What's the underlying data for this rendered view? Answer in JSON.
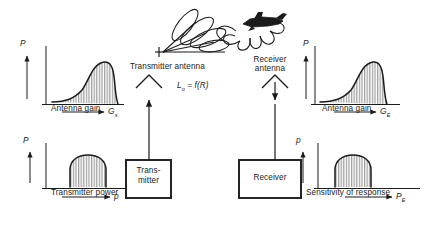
{
  "diagram": {
    "ink_color": "#1b1b1b",
    "hatch_color": "#555555",
    "background": "#ffffff"
  },
  "transmitter_branch": {
    "antenna_label": "Transmitter antenna",
    "box_line1": "Trans-",
    "box_line2": "mitter",
    "gain_plot": {
      "y_axis": "P",
      "caption": "Antenna gain",
      "x_axis_symbol": "G",
      "x_axis_subscript": "s",
      "curve_type": "skewed-peak"
    },
    "power_plot": {
      "y_axis": "P",
      "caption": "Transmitter power",
      "x_axis_symbol": "p",
      "x_axis_subscript": "",
      "curve_type": "dome"
    }
  },
  "path": {
    "loss_formula_symbol": "L",
    "loss_formula_subscript": "o",
    "loss_formula_rest": " = f(R)"
  },
  "target": {
    "name": "aircraft-target",
    "scatter_pattern": "reflection-lobes"
  },
  "receiver_branch": {
    "antenna_label_line1": "Receiver",
    "antenna_label_line2": "antenna",
    "box_label": "Receiver",
    "gain_plot": {
      "y_axis": "P",
      "caption": "Antenna gain",
      "x_axis_symbol": "G",
      "x_axis_subscript": "E",
      "curve_type": "skewed-peak"
    },
    "sensitivity_plot": {
      "y_axis": "p",
      "caption": "Sensitivity of response",
      "x_axis_symbol": "P",
      "x_axis_subscript": "E",
      "curve_type": "dome"
    }
  }
}
